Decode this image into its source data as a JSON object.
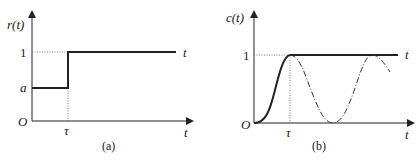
{
  "panels": [
    {
      "id": "a",
      "caption": "(a)",
      "y_axis_label": "r(t)",
      "x_axis_label": "t",
      "origin_label": "O",
      "y_ticks": [
        "1",
        "a"
      ],
      "x_ticks": [
        "τ"
      ],
      "curve_label": "t",
      "description": "Step input: r(t)=a for 0<t<τ, jumps to 1 at t=τ"
    },
    {
      "id": "b",
      "caption": "(b)",
      "y_axis_label": "c(t)",
      "x_axis_label": "t",
      "origin_label": "O",
      "y_ticks": [
        "1"
      ],
      "x_ticks": [
        "τ"
      ],
      "curve_label": "t",
      "description": "Output c(t) rises smoothly from 0 to 1 at t=τ then stays at 1 (solid); dash-dot continuation oscillates between 0 and 1"
    }
  ],
  "colors": {
    "ink": "#222222",
    "dotted": "#555555"
  }
}
